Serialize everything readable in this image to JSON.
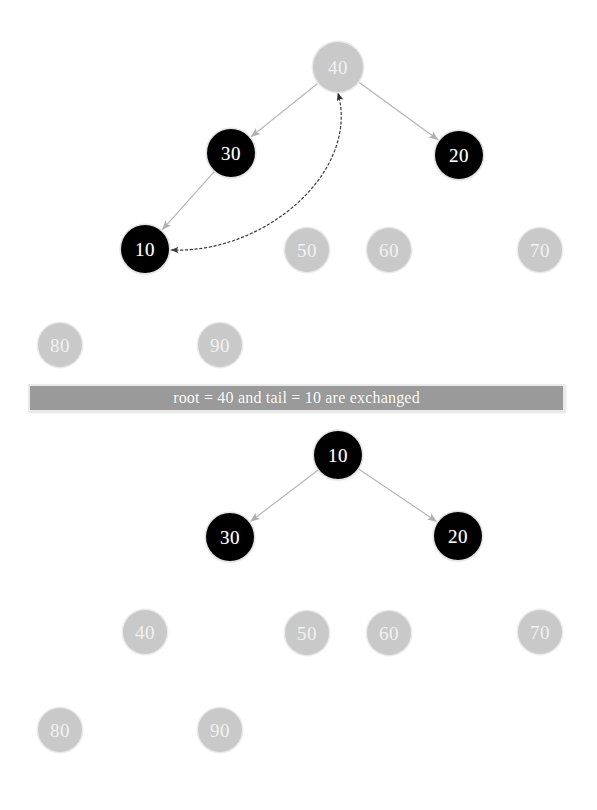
{
  "canvas": {
    "width": 597,
    "height": 810,
    "background": "#ffffff"
  },
  "colors": {
    "active_node_fill": "#000000",
    "active_node_text": "#ffffff",
    "inactive_node_fill": "#c9c9c9",
    "inactive_node_text": "#f2f2f2",
    "edge": "#b6b6b6",
    "swap_arrow": "#3a3a3a",
    "banner_fill": "#9a9a9a",
    "banner_border": "#e9e9e9",
    "banner_text": "#ffffff"
  },
  "banner": {
    "message": "root = 40 and tail = 10 are exchanged",
    "x": 28,
    "y": 384,
    "width": 537,
    "height": 28
  },
  "panels": [
    {
      "id": "before",
      "name": "heap-before-swap",
      "nodes": [
        {
          "id": "b40",
          "label": "40",
          "state": "inactive",
          "cx": 338,
          "cy": 67,
          "r": 25
        },
        {
          "id": "b30",
          "label": "30",
          "state": "active",
          "cx": 231,
          "cy": 153,
          "r": 24
        },
        {
          "id": "b20",
          "label": "20",
          "state": "active",
          "cx": 459,
          "cy": 155,
          "r": 24
        },
        {
          "id": "b10",
          "label": "10",
          "state": "active",
          "cx": 145,
          "cy": 249,
          "r": 24
        },
        {
          "id": "b50",
          "label": "50",
          "state": "inactive",
          "cx": 307,
          "cy": 250,
          "r": 22
        },
        {
          "id": "b60",
          "label": "60",
          "state": "inactive",
          "cx": 389,
          "cy": 250,
          "r": 22
        },
        {
          "id": "b70",
          "label": "70",
          "state": "inactive",
          "cx": 540,
          "cy": 250,
          "r": 22
        },
        {
          "id": "b80",
          "label": "80",
          "state": "inactive",
          "cx": 60,
          "cy": 345,
          "r": 22
        },
        {
          "id": "b90",
          "label": "90",
          "state": "inactive",
          "cx": 220,
          "cy": 345,
          "r": 22
        }
      ],
      "edges": [
        {
          "from": "b40",
          "to": "b30",
          "style": "solid"
        },
        {
          "from": "b40",
          "to": "b20",
          "style": "solid"
        },
        {
          "from": "b30",
          "to": "b10",
          "style": "solid"
        }
      ],
      "swap_arrow": {
        "style": "dotted",
        "double_headed": true,
        "from": "b40",
        "to": "b10",
        "description": "curved dotted double arrow between node 40 and node 10"
      }
    },
    {
      "id": "after",
      "name": "heap-after-swap",
      "nodes": [
        {
          "id": "a10",
          "label": "10",
          "state": "active",
          "cx": 338,
          "cy": 455,
          "r": 24
        },
        {
          "id": "a30",
          "label": "30",
          "state": "active",
          "cx": 230,
          "cy": 537,
          "r": 24
        },
        {
          "id": "a20",
          "label": "20",
          "state": "active",
          "cx": 458,
          "cy": 536,
          "r": 24
        },
        {
          "id": "a40",
          "label": "40",
          "state": "inactive",
          "cx": 145,
          "cy": 632,
          "r": 22
        },
        {
          "id": "a50",
          "label": "50",
          "state": "inactive",
          "cx": 307,
          "cy": 633,
          "r": 22
        },
        {
          "id": "a60",
          "label": "60",
          "state": "inactive",
          "cx": 389,
          "cy": 633,
          "r": 22
        },
        {
          "id": "a70",
          "label": "70",
          "state": "inactive",
          "cx": 540,
          "cy": 632,
          "r": 22
        },
        {
          "id": "a80",
          "label": "80",
          "state": "inactive",
          "cx": 60,
          "cy": 730,
          "r": 22
        },
        {
          "id": "a90",
          "label": "90",
          "state": "inactive",
          "cx": 220,
          "cy": 730,
          "r": 22
        }
      ],
      "edges": [
        {
          "from": "a10",
          "to": "a30",
          "style": "solid"
        },
        {
          "from": "a10",
          "to": "a20",
          "style": "solid"
        }
      ],
      "swap_arrow": null
    }
  ]
}
